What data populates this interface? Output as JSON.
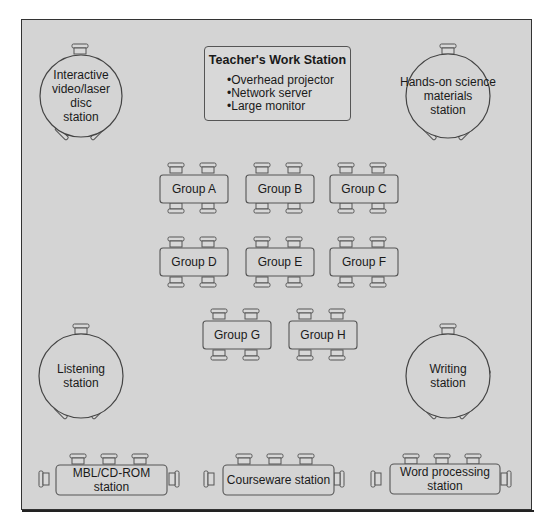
{
  "diagram": {
    "type": "classroom floor plan",
    "colors": {
      "floor": "#d4d4d4",
      "line": "#555555",
      "frame": "#333333"
    },
    "teacher_station": {
      "title": "Teacher's Work Station",
      "items": [
        "Overhead projector",
        "Network server",
        "Large monitor"
      ]
    },
    "round_stations": [
      {
        "id": "interactive",
        "label": "Interactive video/laser disc station",
        "lines": [
          "Interactive",
          "video/laser disc",
          "station"
        ]
      },
      {
        "id": "science",
        "label": "Hands-on science materials station",
        "lines": [
          "Hands-on science",
          "materials",
          "station"
        ]
      },
      {
        "id": "listening",
        "label": "Listening station",
        "lines": [
          "Listening",
          "station"
        ]
      },
      {
        "id": "writing",
        "label": "Writing station",
        "lines": [
          "Writing",
          "station"
        ]
      }
    ],
    "group_tables": [
      "Group A",
      "Group B",
      "Group C",
      "Group D",
      "Group E",
      "Group F",
      "Group G",
      "Group H"
    ],
    "long_stations": [
      {
        "id": "mbl",
        "label": "MBL/CD-ROM station"
      },
      {
        "id": "courseware",
        "label": "Courseware station"
      },
      {
        "id": "wordproc",
        "label": "Word processing station",
        "lines": [
          "Word processing",
          "station"
        ]
      }
    ]
  }
}
